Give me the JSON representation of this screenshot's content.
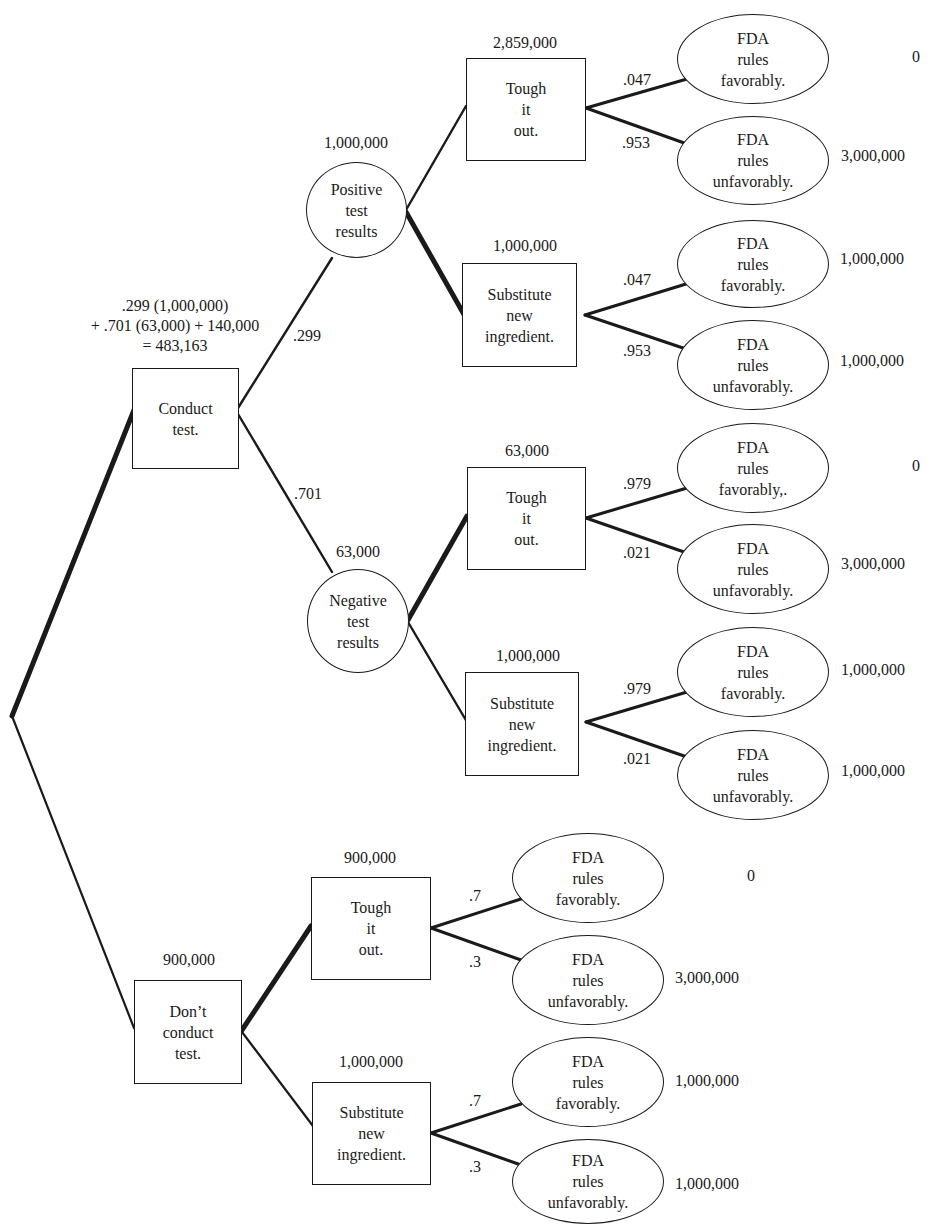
{
  "diagram": {
    "type": "decision-tree",
    "root_calculation": ".299 (1,000,000)\n+ .701 (63,000) + 140,000\n= 483,163",
    "nodes": {
      "conduct": {
        "label": "Conduct\ntest.",
        "value": ""
      },
      "positive": {
        "label": "Positive\ntest\nresults",
        "value": "1,000,000"
      },
      "negative": {
        "label": "Negative\ntest\nresults",
        "value": "63,000"
      },
      "pos_tough": {
        "label": "Tough\nit\nout.",
        "value": "2,859,000"
      },
      "pos_sub": {
        "label": "Substitute\nnew\ningredient.",
        "value": "1,000,000"
      },
      "neg_tough": {
        "label": "Tough\nit\nout.",
        "value": "63,000"
      },
      "neg_sub": {
        "label": "Substitute\nnew\ningredient.",
        "value": "1,000,000"
      },
      "dont": {
        "label": "Don’t\nconduct\ntest.",
        "value": "900,000"
      },
      "dont_tough": {
        "label": "Tough\nit\nout.",
        "value": "900,000"
      },
      "dont_sub": {
        "label": "Substitute\nnew\ningredient.",
        "value": "1,000,000"
      }
    },
    "branch_probs": {
      "positive": ".299",
      "negative": ".701"
    },
    "outcomes": [
      {
        "id": "o1",
        "label": "FDA\nrules\nfavorably.",
        "prob": ".047",
        "payoff": "0"
      },
      {
        "id": "o2",
        "label": "FDA\nrules\nunfavorably.",
        "prob": ".953",
        "payoff": "3,000,000"
      },
      {
        "id": "o3",
        "label": "FDA\nrules\nfavorably.",
        "prob": ".047",
        "payoff": "1,000,000"
      },
      {
        "id": "o4",
        "label": "FDA\nrules\nunfavorably.",
        "prob": ".953",
        "payoff": "1,000,000"
      },
      {
        "id": "o5",
        "label": "FDA\nrules\nfavorably,.",
        "prob": ".979",
        "payoff": "0"
      },
      {
        "id": "o6",
        "label": "FDA\nrules\nunfavorably.",
        "prob": ".021",
        "payoff": "3,000,000"
      },
      {
        "id": "o7",
        "label": "FDA\nrules\nfavorably.",
        "prob": ".979",
        "payoff": "1,000,000"
      },
      {
        "id": "o8",
        "label": "FDA\nrules\nunfavorably.",
        "prob": ".021",
        "payoff": "1,000,000"
      },
      {
        "id": "o9",
        "label": "FDA\nrules\nfavorably.",
        "prob": ".7",
        "payoff": "0"
      },
      {
        "id": "o10",
        "label": "FDA\nrules\nunfavorably.",
        "prob": ".3",
        "payoff": "3,000,000"
      },
      {
        "id": "o11",
        "label": "FDA\nrules\nfavorably.",
        "prob": ".7",
        "payoff": "1,000,000"
      },
      {
        "id": "o12",
        "label": "FDA\nrules\nunfavorably.",
        "prob": ".3",
        "payoff": "1,000,000"
      }
    ],
    "colors": {
      "ink": "#1a1a1a",
      "background": "#ffffff"
    }
  }
}
